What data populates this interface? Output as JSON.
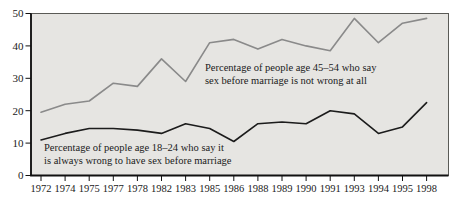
{
  "figure": {
    "background_color": "#ffffff",
    "plot_background": "#e6e5e2",
    "axis_color": "#1a1a1a"
  },
  "chart_data": {
    "type": "line",
    "title": "",
    "xlabel": "",
    "ylabel": "",
    "ylim": [
      0,
      50
    ],
    "yticks": [
      0,
      10,
      20,
      30,
      40,
      50
    ],
    "grid": false,
    "legend_position": "inline-annotations",
    "categories": [
      "1972",
      "1974",
      "1975",
      "1977",
      "1978",
      "1982",
      "1983",
      "1985",
      "1986",
      "1988",
      "1989",
      "1990",
      "1991",
      "1993",
      "1994",
      "1995",
      "1998"
    ],
    "series": [
      {
        "name": "Percentage of people age 45-54 who say sex before marriage is not wrong at all",
        "label_lines": [
          "Percentage of people age 45–54 who say",
          "sex before marriage is not wrong at all"
        ],
        "color": "#8a8a8a",
        "values": [
          19.5,
          22,
          23,
          28.5,
          27.5,
          36,
          29,
          41,
          42,
          39,
          42,
          40,
          38.5,
          48.5,
          41,
          47,
          48.5
        ]
      },
      {
        "name": "Percentage of people age 18-24 who say it is always wrong to have sex before marriage",
        "label_lines": [
          "Percentage of people age 18–24 who say it",
          "is always wrong to have sex before marriage"
        ],
        "color": "#1c1c1c",
        "values": [
          11,
          13,
          14.5,
          14.5,
          14,
          13,
          16,
          14.5,
          10.5,
          16,
          16.5,
          16,
          20,
          19,
          13,
          15,
          22.5
        ]
      }
    ]
  }
}
